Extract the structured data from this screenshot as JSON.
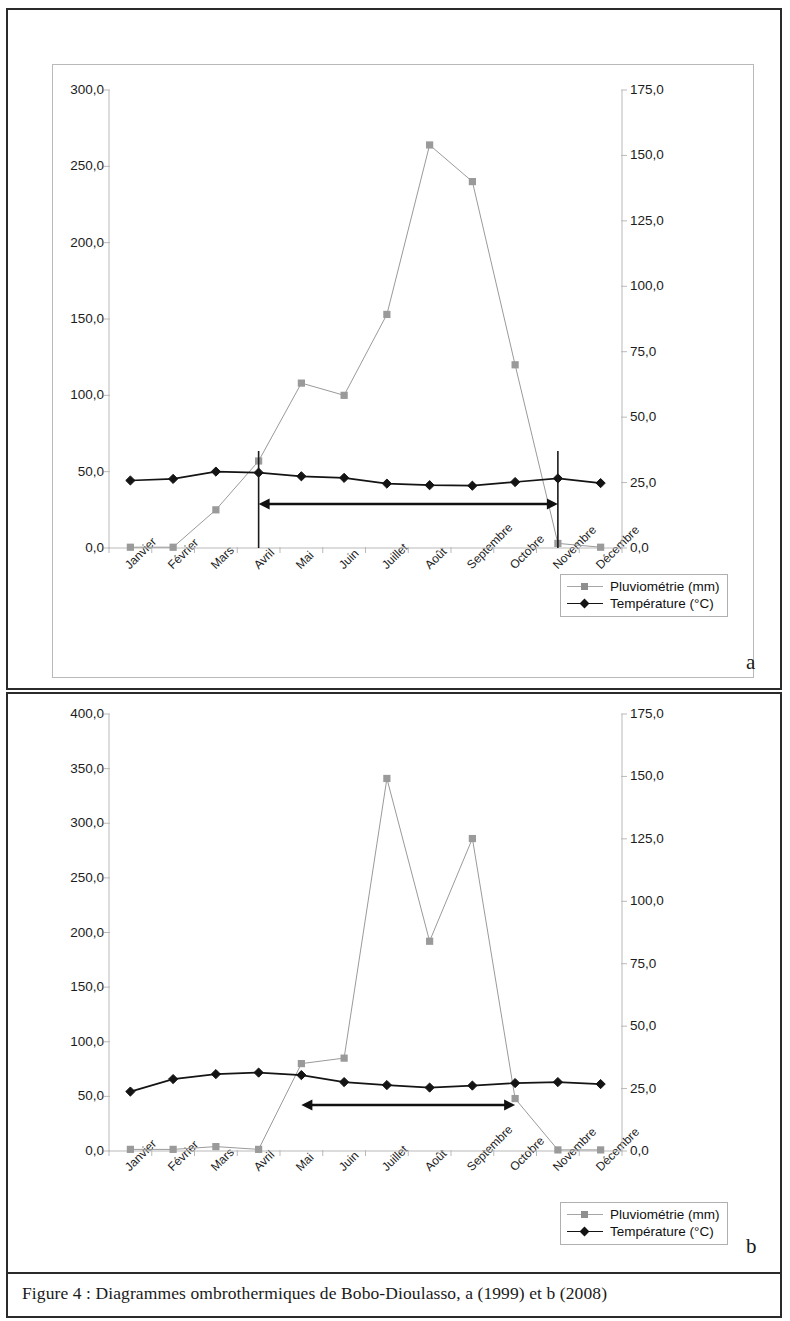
{
  "caption": "Figure 4 : Diagrammes ombrothermiques de Bobo-Dioulasso, a (1999) et b (2008)",
  "panel_a_letter": "a",
  "panel_b_letter": "b",
  "legend": {
    "rain_label": "Pluviométrie (mm)",
    "temp_label": "Température (°C)"
  },
  "colors": {
    "rain": "#9a9a9a",
    "temp": "#141414",
    "axis": "#b9b9b9",
    "text": "#1c1c1c",
    "border": "#2b2b2b"
  },
  "chart_data": [
    {
      "id": "a",
      "type": "line",
      "title": "",
      "subtitle": "a (1999)",
      "xlabel": "",
      "ylabel": "",
      "grid": false,
      "legend_position": "bottom-right",
      "categories": [
        "Janvier",
        "Février",
        "Mars",
        "Avril",
        "Mai",
        "Juin",
        "Juillet",
        "Août",
        "Septembre",
        "Octobre",
        "Novembre",
        "Décembre"
      ],
      "y_left": {
        "label": "Pluviométrie (mm)",
        "ylim": [
          0,
          300
        ],
        "ticks": [
          0,
          50,
          100,
          150,
          200,
          250,
          300
        ],
        "tick_labels": [
          "0,0",
          "50,0",
          "100,0",
          "150,0",
          "200,0",
          "250,0",
          "300,0"
        ]
      },
      "y_right": {
        "label": "Température (°C)",
        "ylim": [
          0,
          175
        ],
        "ticks": [
          0,
          25,
          50,
          75,
          100,
          125,
          150,
          175
        ],
        "tick_labels": [
          "0,0",
          "25,0",
          "50,0",
          "75,0",
          "100,0",
          "125,0",
          "150,0",
          "175,0"
        ]
      },
      "series": [
        {
          "name": "Pluviométrie (mm)",
          "axis": "left",
          "marker": "square",
          "color": "#9a9a9a",
          "values": [
            0.5,
            0.5,
            25.0,
            57.0,
            108.0,
            100.0,
            153.0,
            264.0,
            240.0,
            120.0,
            3.0,
            0.5
          ]
        },
        {
          "name": "Température (°C)",
          "axis": "right",
          "marker": "diamond",
          "color": "#141414",
          "values": [
            25.8,
            26.4,
            29.2,
            28.8,
            27.4,
            26.8,
            24.6,
            24.0,
            23.8,
            25.2,
            26.6,
            24.8
          ]
        }
      ],
      "annotations": [
        {
          "type": "vline",
          "at_category": "Avril"
        },
        {
          "type": "vline",
          "at_category": "Novembre"
        },
        {
          "type": "double-arrow",
          "from_category": "Avril",
          "to_category": "Novembre"
        }
      ]
    },
    {
      "id": "b",
      "type": "line",
      "title": "",
      "subtitle": "b (2008)",
      "xlabel": "",
      "ylabel": "",
      "grid": false,
      "legend_position": "bottom-right",
      "categories": [
        "Janvier",
        "Février",
        "Mars",
        "Avril",
        "Mai",
        "Juin",
        "Juillet",
        "Août",
        "Septembre",
        "Octobre",
        "Novembre",
        "Décembre"
      ],
      "y_left": {
        "label": "Pluviométrie (mm)",
        "ylim": [
          0,
          400
        ],
        "ticks": [
          0,
          50,
          100,
          150,
          200,
          250,
          300,
          350,
          400
        ],
        "tick_labels": [
          "0,0",
          "50,0",
          "100,0",
          "150,0",
          "200,0",
          "250,0",
          "300,0",
          "350,0",
          "400,0"
        ]
      },
      "y_right": {
        "label": "Température (°C)",
        "ylim": [
          0,
          175
        ],
        "ticks": [
          0,
          25,
          50,
          75,
          100,
          125,
          150,
          175
        ],
        "tick_labels": [
          "0,0",
          "25,0",
          "50,0",
          "75,0",
          "100,0",
          "125,0",
          "150,0",
          "175,0"
        ]
      },
      "series": [
        {
          "name": "Pluviométrie (mm)",
          "axis": "left",
          "marker": "square",
          "color": "#9a9a9a",
          "values": [
            1.5,
            1.5,
            4.0,
            1.5,
            80.0,
            85.0,
            341.0,
            192.0,
            286.0,
            48.0,
            1.0,
            1.0
          ]
        },
        {
          "name": "Température (°C)",
          "axis": "right",
          "marker": "diamond",
          "color": "#141414",
          "values": [
            23.8,
            28.8,
            30.8,
            31.4,
            30.4,
            27.6,
            26.4,
            25.4,
            26.2,
            27.2,
            27.6,
            26.8
          ]
        }
      ],
      "annotations": [
        {
          "type": "double-arrow",
          "from_category": "Mai",
          "to_category": "Octobre"
        }
      ]
    }
  ]
}
